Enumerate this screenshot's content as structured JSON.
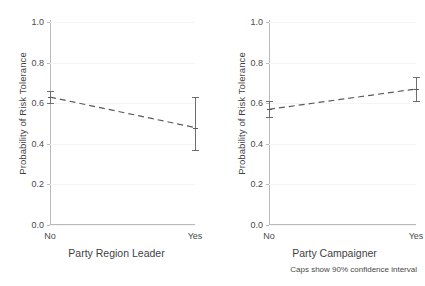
{
  "figure": {
    "background": "#ffffff",
    "caption": "Caps show 90% confidence interval",
    "line_color": "#5a5a5a",
    "error_color": "#6e6e6e",
    "grid_color": "#f4f4f4",
    "axis_color": "#b9b9b9"
  },
  "chart_data": [
    {
      "type": "line",
      "panel": "left",
      "title": "",
      "xlabel": "Party Region Leader",
      "ylabel": "Probability of Risk Tolerance",
      "categories": [
        "No",
        "Yes"
      ],
      "x": [
        0,
        1
      ],
      "values": [
        0.63,
        0.48
      ],
      "ci_low": [
        0.6,
        0.37
      ],
      "ci_high": [
        0.66,
        0.63
      ],
      "ylim": [
        0.0,
        1.0
      ],
      "yticks": [
        0.0,
        0.2,
        0.4,
        0.6,
        0.8,
        1.0
      ],
      "ytick_labels": [
        "0.0",
        "0.2",
        "0.4",
        "0.6",
        "0.8",
        "1.0"
      ],
      "xtick_labels": [
        "No",
        "Yes"
      ],
      "grid": true,
      "legend": "none",
      "linestyle": "dashed",
      "error_bars": "90% confidence interval"
    },
    {
      "type": "line",
      "panel": "right",
      "title": "",
      "xlabel": "Party Campaigner",
      "ylabel": "Probability of Risk Tolerance",
      "categories": [
        "No",
        "Yes"
      ],
      "x": [
        0,
        1
      ],
      "values": [
        0.57,
        0.67
      ],
      "ci_low": [
        0.53,
        0.61
      ],
      "ci_high": [
        0.61,
        0.73
      ],
      "ylim": [
        0.0,
        1.0
      ],
      "yticks": [
        0.0,
        0.2,
        0.4,
        0.6,
        0.8,
        1.0
      ],
      "ytick_labels": [
        "0.0",
        "0.2",
        "0.4",
        "0.6",
        "0.8",
        "1.0"
      ],
      "xtick_labels": [
        "No",
        "Yes"
      ],
      "grid": true,
      "legend": "none",
      "linestyle": "dashed",
      "error_bars": "90% confidence interval"
    }
  ]
}
